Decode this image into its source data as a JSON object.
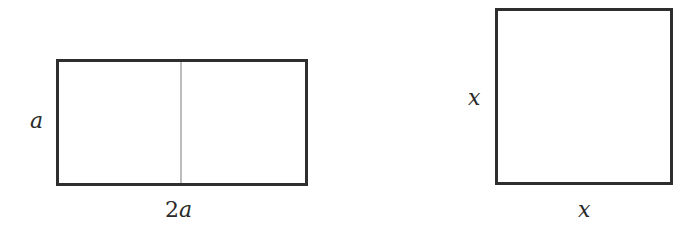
{
  "figure": {
    "rectangle": {
      "height_label": "a",
      "width_label_coef": "2",
      "width_label_var": "a",
      "divided_into": 2
    },
    "square": {
      "height_label": "x",
      "width_label": "x"
    }
  }
}
